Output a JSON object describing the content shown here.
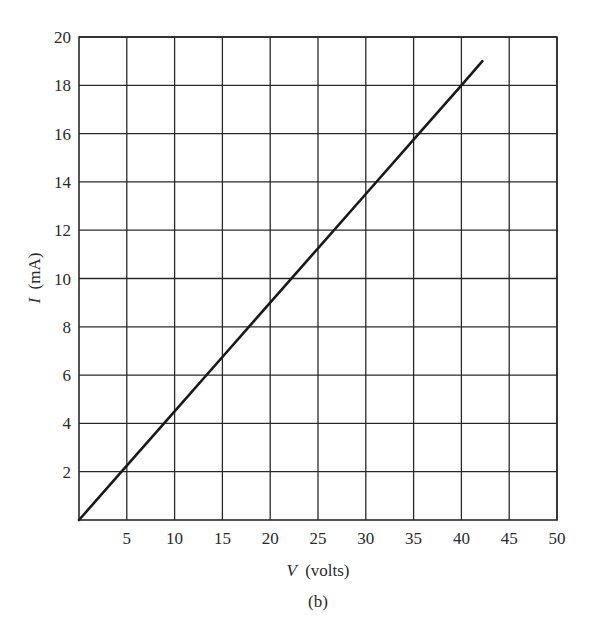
{
  "chart_data": {
    "type": "line",
    "title": "",
    "caption": "(b)",
    "xlabel": "V (volts)",
    "xlabel_var": "V",
    "xlabel_unit": "(volts)",
    "ylabel": "I (mA)",
    "ylabel_var": "I",
    "ylabel_unit": "(mA)",
    "xlim": [
      0,
      50
    ],
    "ylim": [
      0,
      20
    ],
    "xticks": [
      5,
      10,
      15,
      20,
      25,
      30,
      35,
      40,
      45,
      50
    ],
    "yticks": [
      2,
      4,
      6,
      8,
      10,
      12,
      14,
      16,
      18,
      20
    ],
    "grid": true,
    "legend": null,
    "series": [
      {
        "name": "I-V characteristic",
        "x": [
          0,
          5,
          10,
          15,
          20,
          25,
          30,
          35,
          40,
          42.2
        ],
        "y": [
          0,
          2.25,
          4.5,
          6.75,
          9.0,
          11.25,
          13.5,
          15.75,
          18.0,
          19.0
        ]
      }
    ],
    "colors": {
      "line": "#1a1a1a",
      "grid": "#2a2a2a",
      "background": "#ffffff"
    }
  }
}
